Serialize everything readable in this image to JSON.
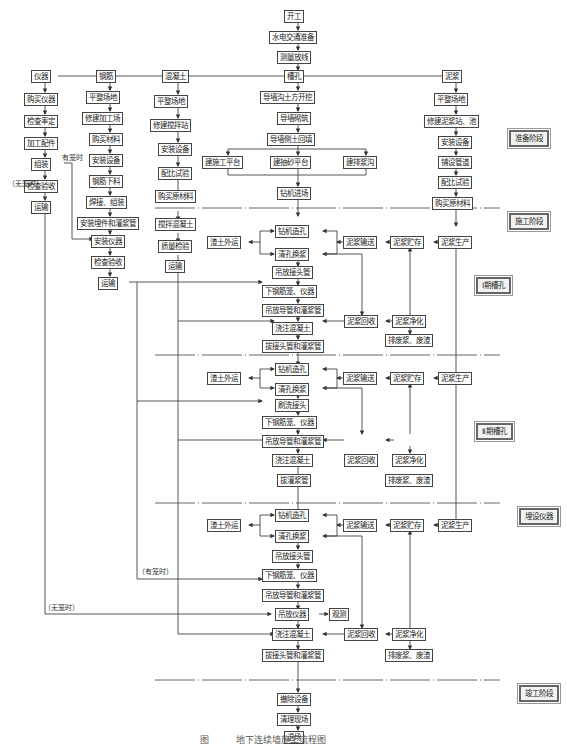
{
  "top_flow": [
    "开工",
    "水电交通准备",
    "测量放线"
  ],
  "branches": {
    "instrument": {
      "title": "仪器",
      "steps": [
        "购买仪器",
        "检查率定",
        "加工配件",
        "组装",
        "检查验收",
        "运输"
      ]
    },
    "rebar": {
      "title": "钢筋",
      "steps": [
        "平整场地",
        "修建加工场",
        "购买材料",
        "安装设备",
        "钢筋下料",
        "焊接、组装",
        "安装埋件和灌浆管",
        "安装仪器",
        "检查验收",
        "运输"
      ]
    },
    "concrete": {
      "title": "混凝土",
      "steps": [
        "平整场地",
        "修建搅拌站",
        "安装设备",
        "配比试验",
        "购买原材料",
        "搅拌混凝土",
        "质量检验",
        "运输"
      ]
    },
    "trench": {
      "title": "槽孔",
      "steps": [
        "导墙沟土方开挖",
        "导墙砌筑",
        "导墙侧土回填"
      ],
      "platforms": [
        "建施工平台",
        "建抽砂平台",
        "建排浆沟"
      ],
      "after": "钻机进场"
    },
    "slurry": {
      "title": "泥浆",
      "steps": [
        "平整场地",
        "修建泥浆站、池",
        "安装设备",
        "铺设管道",
        "配比试验",
        "购买原材料"
      ]
    }
  },
  "notes": {
    "with_cage": "有笼时",
    "without_cage": "（无笼时）",
    "with_cage_paren": "（有笼时）",
    "without_cage_paren": "（无笼时）"
  },
  "stages": {
    "prep": "准备阶段",
    "construction": "施工阶段",
    "phase1": "Ⅰ期槽孔",
    "phase2": "Ⅱ期槽孔",
    "embed": "埋设仪器",
    "completion": "竣工阶段"
  },
  "phase1": {
    "drill": "钻机造孔",
    "clean": "清孔换浆",
    "spoil": "渣土外运",
    "joint": "吊放接头管",
    "cage": "下钢筋笼、仪器",
    "tremie": "吊放导管和灌浆管",
    "pour": "浇注混凝土",
    "pull": "拔接头管和灌浆管",
    "s_transport": "泥浆输送",
    "s_store": "泥浆贮存",
    "s_produce": "泥浆生产",
    "s_recover": "泥浆回收",
    "s_purify": "泥浆净化",
    "s_waste": "排废浆、废渣"
  },
  "phase2": {
    "drill": "钻机造孔",
    "clean": "清孔换浆",
    "spoil": "渣土外运",
    "brush": "刷洗接头",
    "cage": "下钢筋笼、仪器",
    "tremie": "吊放导管和灌浆管",
    "pour": "浇注混凝土",
    "pull": "拔灌浆管",
    "s_transport": "泥浆输送",
    "s_store": "泥浆贮存",
    "s_produce": "泥浆生产",
    "s_recover": "泥浆回收",
    "s_purify": "泥浆净化",
    "s_waste": "排废浆、废渣"
  },
  "phase3": {
    "drill": "钻机造孔",
    "clean": "清孔换浆",
    "spoil": "渣土外运",
    "joint": "吊放接头管",
    "cage": "下钢筋笼、仪器",
    "tremie": "吊放导管和灌浆管",
    "inst": "吊放仪器",
    "observe": "观测",
    "pour": "浇注混凝土",
    "pull": "拔接头管和灌浆管",
    "s_transport": "泥浆输送",
    "s_store": "泥浆贮存",
    "s_produce": "泥浆生产",
    "s_recover": "泥浆回收",
    "s_purify": "泥浆净化",
    "s_waste": "排废浆、废渣"
  },
  "finish": [
    "撤除设备",
    "清理现场",
    "退场"
  ],
  "caption": "图　　　地下连续墙施工流程图"
}
